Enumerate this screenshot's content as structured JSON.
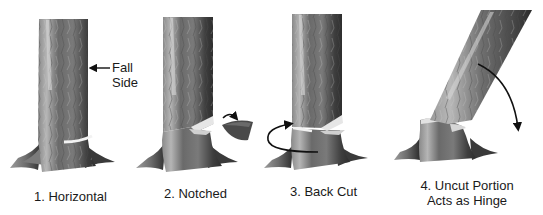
{
  "figure": {
    "annotation": {
      "label_line1": "Fall",
      "label_line2": "Side",
      "arrow": "left-arrow"
    },
    "steps": [
      {
        "number": "1.",
        "caption": "1. Horizontal",
        "icon": "tree-trunk-horizontal-cut"
      },
      {
        "number": "2.",
        "caption": "2. Notched",
        "icon": "tree-trunk-notched",
        "arrow": "notch-removal-arrow"
      },
      {
        "number": "3.",
        "caption": "3. Back Cut",
        "icon": "tree-trunk-back-cut",
        "arrow": "back-cut-curved-arrow"
      },
      {
        "number": "4.",
        "caption_line1": "4. Uncut Portion",
        "caption_line2": "Acts as Hinge",
        "icon": "tree-falling-hinge",
        "arrow": "falling-direction-arrow"
      }
    ],
    "colors": {
      "bark_dark": "#3a3a3a",
      "bark_mid": "#6e6e6e",
      "bark_light": "#a8a8a8",
      "cut_face": "#e8e8e8",
      "text": "#1a1a1a",
      "bleed_through_text": "#ececec"
    }
  }
}
